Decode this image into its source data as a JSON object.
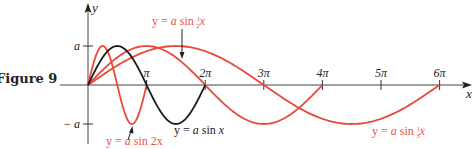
{
  "figure": {
    "label": "Figure 9"
  },
  "colors": {
    "red": "#e8483a",
    "black": "#1a1a1a",
    "axis": "#333333"
  },
  "chart_data": {
    "type": "line",
    "title": "Figure 9",
    "xlabel": "x",
    "ylabel": "y",
    "x_ticks": [
      {
        "value": 3.14159,
        "label": "π"
      },
      {
        "value": 6.28319,
        "label": "2π"
      },
      {
        "value": 9.42478,
        "label": "3π"
      },
      {
        "value": 12.56637,
        "label": "4π"
      },
      {
        "value": 15.70796,
        "label": "5π"
      },
      {
        "value": 18.84956,
        "label": "6π"
      }
    ],
    "y_ticks": [
      {
        "value": 1,
        "label": "a"
      },
      {
        "value": -1,
        "label": "− a"
      }
    ],
    "xlim": [
      0,
      19.5
    ],
    "ylim": [
      -1.2,
      2
    ],
    "grid": false,
    "legend": "none (inline labels)",
    "series": [
      {
        "name": "y = a sin 2x",
        "function": "a*sin(2x)",
        "domain": [
          0,
          3.14159
        ],
        "color": "red",
        "label": {
          "text": "y = a sin 2x",
          "x": 107,
          "y": 145
        }
      },
      {
        "name": "y = a sin x",
        "function": "a*sin(x)",
        "domain": [
          0,
          6.28319
        ],
        "color": "black",
        "label": {
          "text": "y = a sin x",
          "x": 174,
          "y": 134
        }
      },
      {
        "name": "y = a sin ½x",
        "function": "a*sin(x/2)",
        "domain": [
          0,
          12.56637
        ],
        "color": "red",
        "label": {
          "text": "y = a sin ½x",
          "x": 152,
          "y": 26
        }
      },
      {
        "name": "y = a sin ⅓x",
        "function": "a*sin(x/3)",
        "domain": [
          0,
          18.84956
        ],
        "color": "red",
        "label": {
          "text": "y = a sin ⅓x",
          "x": 372,
          "y": 135
        }
      }
    ]
  },
  "annotations": {
    "eq_sin2x": {
      "prefix": "y = ",
      "a": "a",
      "rest": " sin 2x"
    },
    "eq_sinx": {
      "prefix": "y = ",
      "a": "a",
      "rest": " sin ",
      "x": "x"
    },
    "eq_sinhalf": {
      "prefix": "y = ",
      "a": "a",
      "rest": " sin ",
      "num": "1",
      "den": "2",
      "x": "x"
    },
    "eq_sinthird": {
      "prefix": "y = ",
      "a": "a",
      "rest": " sin ",
      "num": "1",
      "den": "3",
      "x": "x"
    }
  }
}
